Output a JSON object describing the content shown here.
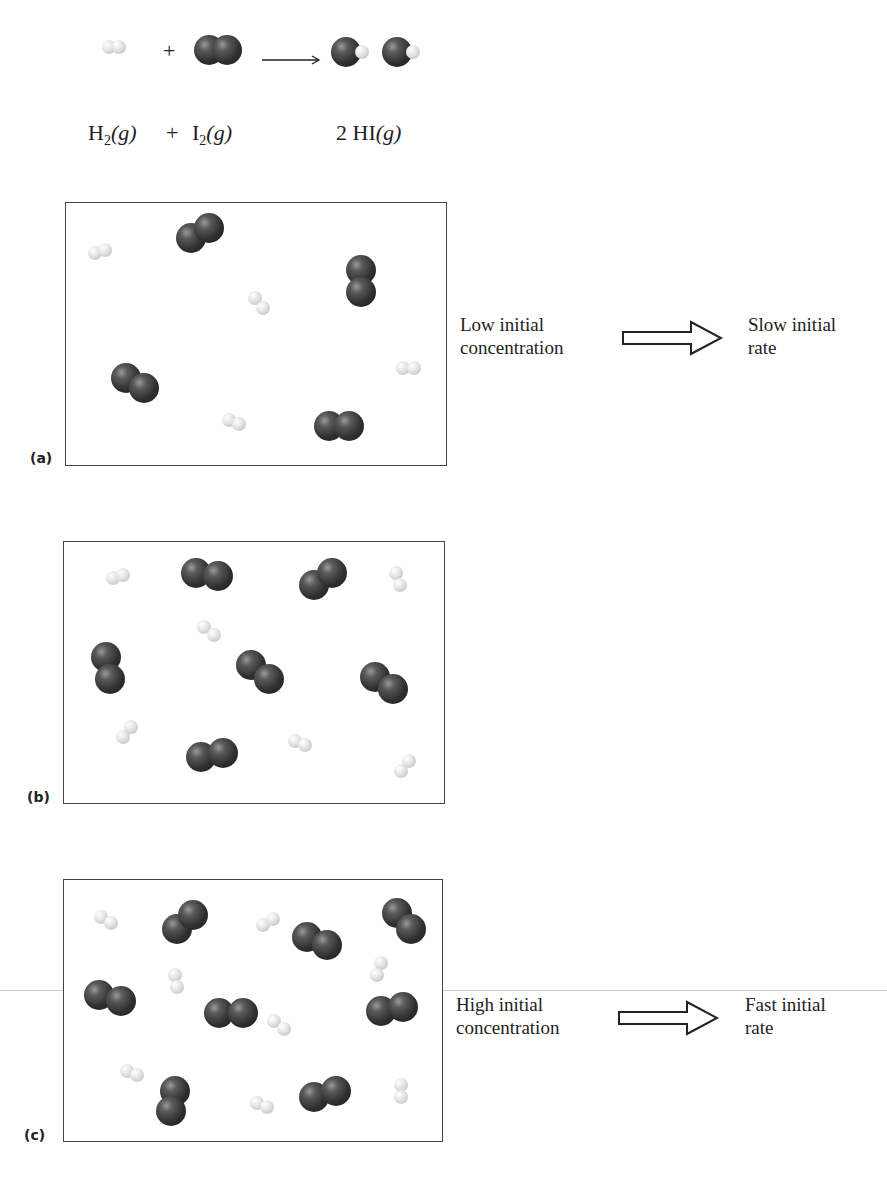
{
  "equation": {
    "reactant1": {
      "symbol": "H",
      "subscript": "2",
      "state": "(g)"
    },
    "plus": "+",
    "reactant2": {
      "symbol": "I",
      "subscript": "2",
      "state": "(g)"
    },
    "product": {
      "coefficient": "2",
      "symbol": "HI",
      "state": "(g)"
    },
    "arrow": "⟶"
  },
  "panels": [
    {
      "label": "(a)",
      "description": "Low concentration: 4 I2 and 4 H2 molecules",
      "caption_left": [
        "Low initial",
        "concentration"
      ],
      "caption_right": [
        "Slow initial",
        "rate"
      ]
    },
    {
      "label": "(b)",
      "description": "Medium concentration: 6 I2 and 6 H2 molecules"
    },
    {
      "label": "(c)",
      "description": "High concentration: 8 I2 and 8 H2 molecules",
      "caption_left": [
        "High initial",
        "concentration"
      ],
      "caption_right": [
        "Fast initial",
        "rate"
      ]
    }
  ],
  "colors": {
    "iodine": "#2f2f2f",
    "hydrogen": "#e6e6e6",
    "border": "#444444"
  }
}
